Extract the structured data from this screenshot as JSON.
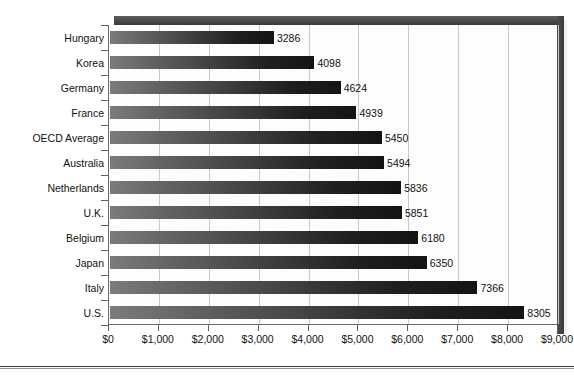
{
  "figure": {
    "title_sliver": "",
    "background": "#ffffff",
    "axis_color": "#5f5f5f",
    "grid_color": "#c9c9c9",
    "bar_gradient_start": "#7b7b7b",
    "bar_gradient_end": "#141414"
  },
  "chart_data": {
    "type": "bar",
    "orientation": "horizontal",
    "title": "",
    "subtitle": "",
    "xlabel": "",
    "ylabel": "",
    "xlim": [
      0,
      9000
    ],
    "xtick_step": 1000,
    "grid": true,
    "legend": false,
    "categories": [
      "Hungary",
      "Korea",
      "Germany",
      "France",
      "OECD Average",
      "Australia",
      "Netherlands",
      "U.K.",
      "Belgium",
      "Japan",
      "Italy",
      "U.S."
    ],
    "values": [
      3286,
      4098,
      4624,
      4939,
      5450,
      5494,
      5836,
      5851,
      6180,
      6350,
      7366,
      8305
    ],
    "data_labels": [
      "3286",
      "4098",
      "4624",
      "4939",
      "5450",
      "5494",
      "5836",
      "5851",
      "6180",
      "6350",
      "7366",
      "8305"
    ],
    "xticks": [
      0,
      1000,
      2000,
      3000,
      4000,
      5000,
      6000,
      7000,
      8000,
      9000
    ],
    "xticklabels": [
      "$0",
      "$1,000",
      "$2,000",
      "$3,000",
      "$4,000",
      "$5,000",
      "$6,000",
      "$7,000",
      "$8,000",
      "$9,000"
    ]
  }
}
